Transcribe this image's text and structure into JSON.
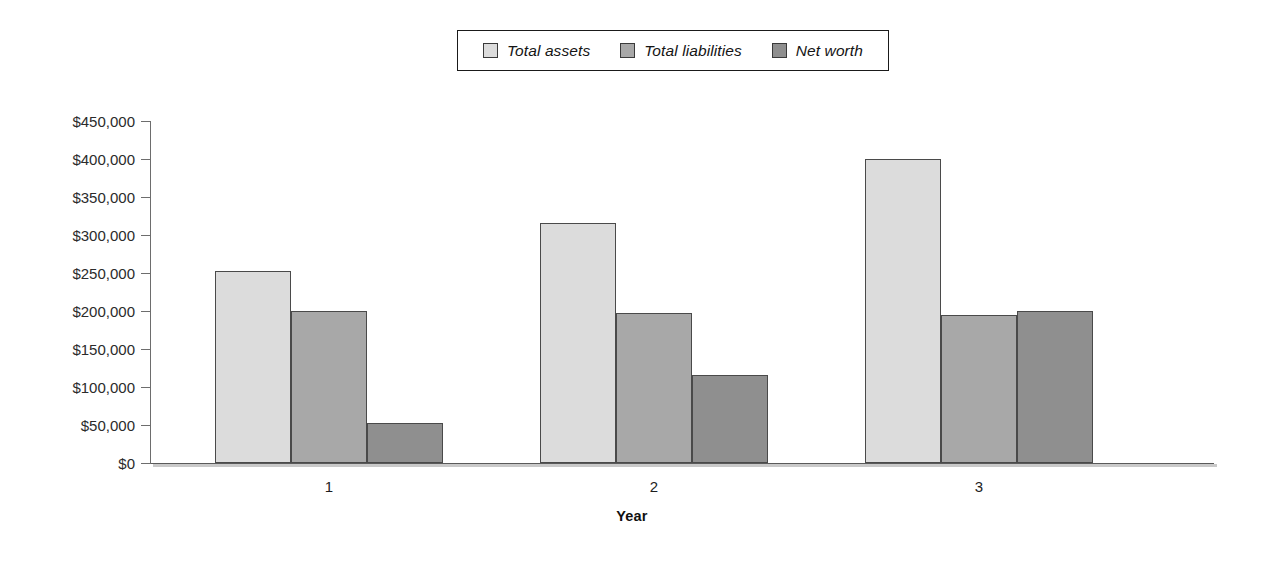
{
  "chart_data": {
    "type": "bar",
    "title": "",
    "subtitle": "",
    "xlabel": "Year",
    "ylabel": "",
    "categories": [
      "1",
      "2",
      "3"
    ],
    "series": [
      {
        "name": "Total assets",
        "color": "#dcdcdc",
        "values": [
          252000,
          316000,
          400000
        ]
      },
      {
        "name": "Total liabilities",
        "color": "#a8a8a8",
        "values": [
          200000,
          197000,
          195000
        ]
      },
      {
        "name": "Net worth",
        "color": "#8f8f8f",
        "values": [
          52000,
          116000,
          200000
        ]
      }
    ],
    "ylim": [
      0,
      450000
    ],
    "ytick_values": [
      0,
      50000,
      100000,
      150000,
      200000,
      250000,
      300000,
      350000,
      400000,
      450000
    ],
    "ytick_labels": [
      "$0",
      "$50,000",
      "$100,000",
      "$150,000",
      "$200,000",
      "$250,000",
      "$300,000",
      "$350,000",
      "$400,000",
      "$450,000"
    ],
    "grid": false,
    "legend_position": "top-center",
    "bar_outline_color": "#4a4a4a",
    "axis_color": "#5a5a5a"
  },
  "legend": {
    "entries": [
      {
        "label": "Total assets"
      },
      {
        "label": "Total liabilities"
      },
      {
        "label": "Net worth"
      }
    ]
  },
  "axes": {
    "x_title": "Year",
    "x_categories": [
      "1",
      "2",
      "3"
    ]
  }
}
